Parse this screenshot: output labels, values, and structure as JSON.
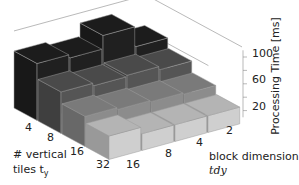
{
  "chart_data": {
    "type": "bar3d",
    "title": "",
    "zlabel": "Processing Time [ms]",
    "xlabel": "# vertical tiles t_y",
    "ylabel": "block dimension tdy",
    "row_categories": [
      "4",
      "8",
      "16",
      "32"
    ],
    "col_categories": [
      "16",
      "8",
      "4",
      "2"
    ],
    "zticks": [
      "20",
      "60",
      "100"
    ],
    "zlim": [
      0,
      110
    ],
    "series": [
      {
        "name": "4",
        "values": [
          85,
          80,
          100,
          70
        ],
        "color": "#1c1c1c"
      },
      {
        "name": "8",
        "values": [
          62,
          58,
          60,
          55
        ],
        "color": "#4a4a4a"
      },
      {
        "name": "16",
        "values": [
          45,
          42,
          40,
          38
        ],
        "color": "#7a7a7a"
      },
      {
        "name": "32",
        "values": [
          35,
          25,
          25,
          25
        ],
        "color": "#b4b4b4"
      }
    ]
  },
  "labels": {
    "z_axis": "Processing Time [ms]",
    "x_axis_line1": "# vertical",
    "x_axis_line2": "tiles t",
    "x_axis_sub": "y",
    "y_axis_line1": "block dimension",
    "y_axis_line2": "tdy",
    "z_tick_100": "100",
    "z_tick_60": "60",
    "z_tick_20": "20",
    "row_4": "4",
    "row_8": "8",
    "row_16": "16",
    "row_32": "32",
    "col_16": "16",
    "col_8": "8",
    "col_4": "4",
    "col_2": "2"
  }
}
